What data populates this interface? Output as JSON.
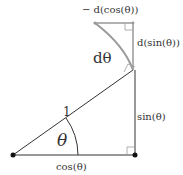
{
  "diagram": {
    "labels": {
      "neg_dcos": "− d(cos(θ))",
      "dsin": "d(sin(θ))",
      "dtheta": "dθ",
      "hyp": "1",
      "theta": "θ",
      "sin": "sin(θ)",
      "cos": "cos(θ)"
    },
    "colors": {
      "main_lines": "#333333",
      "small_triangle": "#999999",
      "points": "#111111"
    }
  }
}
